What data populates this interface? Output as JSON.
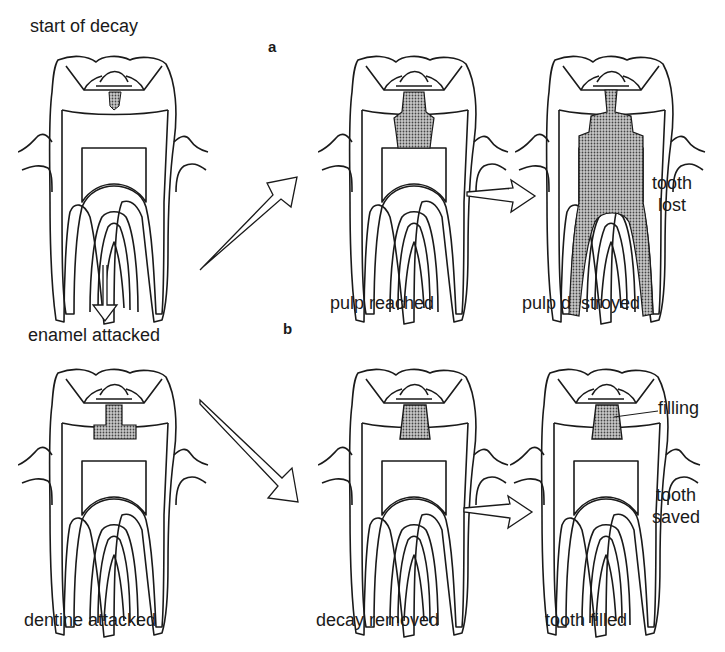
{
  "diagram": {
    "sections": {
      "a": "a",
      "b": "b"
    },
    "stages": [
      {
        "id": "start",
        "label": "start of decay"
      },
      {
        "id": "enamel",
        "label": "enamel attacked"
      },
      {
        "id": "dentine",
        "label": "dentine attacked"
      },
      {
        "id": "pulp_reached",
        "label": "pulp reached"
      },
      {
        "id": "pulp_destroyed",
        "label": "pulp destroyed"
      },
      {
        "id": "decay_removed",
        "label": "decay removed"
      },
      {
        "id": "tooth_filled",
        "label": "tooth filled"
      }
    ],
    "annotations": {
      "tooth_lost_1": "tooth",
      "tooth_lost_2": "lost",
      "tooth_saved_1": "tooth",
      "tooth_saved_2": "saved",
      "filling": "filling"
    },
    "colors": {
      "line": "#1a1a1a",
      "decay_fill": "#8a8a8a",
      "background": "#ffffff"
    }
  }
}
